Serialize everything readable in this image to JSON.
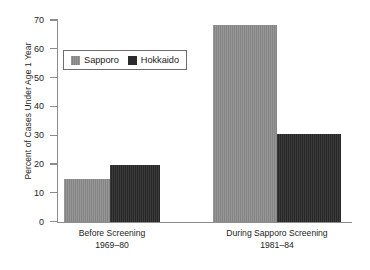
{
  "chart_data": {
    "type": "bar",
    "title": "",
    "xlabel": "",
    "ylabel": "Percent of Cases Under Age 1 Year",
    "ylim": [
      0,
      70
    ],
    "yticks": [
      0,
      10,
      20,
      30,
      40,
      50,
      60,
      70
    ],
    "ytick_labels": [
      "0",
      "10",
      "20",
      "30",
      "40",
      "50",
      "60",
      "70"
    ],
    "grid": false,
    "legend_position": "upper left",
    "categories": [
      "Before Screening\n1969–80",
      "During Sapporo Screening\n1981–84"
    ],
    "category_lines": [
      {
        "line1": "Before Screening",
        "line2": "1969–80"
      },
      {
        "line1": "During Sapporo Screening",
        "line2": "1981–84"
      }
    ],
    "series": [
      {
        "name": "Sapporo",
        "color": "#8a8a8a",
        "values": [
          15,
          68.5
        ]
      },
      {
        "name": "Hokkaido",
        "color": "#2b2b2b",
        "values": [
          19.8,
          30.5
        ]
      }
    ]
  },
  "legend": {
    "entries": [
      {
        "label": "Sapporo",
        "swatch": "sapporo-swatch"
      },
      {
        "label": "Hokkaido",
        "swatch": "hokkaido-swatch"
      }
    ]
  },
  "axes": {
    "y_title": "Percent of Cases Under Age 1 Year",
    "y_ticks": [
      "70",
      "60",
      "50",
      "40",
      "30",
      "20",
      "10",
      "0"
    ]
  },
  "colors": {
    "sapporo": "#8a8a8a",
    "hokkaido": "#2b2b2b",
    "axis": "#8c8c8c",
    "text": "#1a1a1a",
    "background": "#ffffff"
  }
}
